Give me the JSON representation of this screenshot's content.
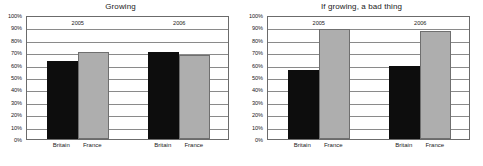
{
  "chart_data": [
    {
      "type": "bar",
      "title": "Growing",
      "xlabel": "",
      "ylabel": "",
      "ylim": [
        0,
        100
      ],
      "grid": true,
      "legend_position": "none",
      "group_labels": [
        "2005",
        "2006"
      ],
      "categories": [
        "Britain",
        "France",
        "Britain",
        "France"
      ],
      "series": [
        {
          "name": "Britain",
          "color": "#0d0d0d",
          "values": [
            63,
            70
          ]
        },
        {
          "name": "France",
          "color": "#aeaeae",
          "values": [
            70,
            68
          ]
        }
      ],
      "bars": [
        {
          "group": "2005",
          "category": "Britain",
          "value": 63,
          "style": "dark"
        },
        {
          "group": "2005",
          "category": "France",
          "value": 70,
          "style": "light"
        },
        {
          "group": "2006",
          "category": "Britain",
          "value": 70,
          "style": "dark"
        },
        {
          "group": "2006",
          "category": "France",
          "value": 68,
          "style": "light"
        }
      ],
      "ticks": [
        "0%",
        "10%",
        "20%",
        "30%",
        "40%",
        "50%",
        "60%",
        "70%",
        "80%",
        "90%",
        "100%"
      ]
    },
    {
      "type": "bar",
      "title": "If growing, a bad thing",
      "xlabel": "",
      "ylabel": "",
      "ylim": [
        0,
        100
      ],
      "grid": true,
      "legend_position": "none",
      "group_labels": [
        "2005",
        "2006"
      ],
      "categories": [
        "Britain",
        "France",
        "Britain",
        "France"
      ],
      "series": [
        {
          "name": "Britain",
          "color": "#0d0d0d",
          "values": [
            56,
            59
          ]
        },
        {
          "name": "France",
          "color": "#aeaeae",
          "values": [
            89,
            87
          ]
        }
      ],
      "bars": [
        {
          "group": "2005",
          "category": "Britain",
          "value": 56,
          "style": "dark"
        },
        {
          "group": "2005",
          "category": "France",
          "value": 89,
          "style": "light"
        },
        {
          "group": "2006",
          "category": "Britain",
          "value": 59,
          "style": "dark"
        },
        {
          "group": "2006",
          "category": "France",
          "value": 87,
          "style": "light"
        }
      ],
      "ticks": [
        "0%",
        "10%",
        "20%",
        "30%",
        "40%",
        "50%",
        "60%",
        "70%",
        "80%",
        "90%",
        "100%"
      ]
    }
  ]
}
